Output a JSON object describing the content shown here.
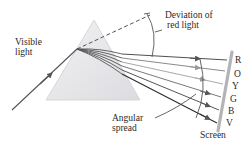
{
  "diagram": {
    "labels": {
      "visible_light": [
        "Visible",
        "light"
      ],
      "deviation": [
        "Deviation of",
        "red light"
      ],
      "angular_spread": [
        "Angular",
        "spread"
      ],
      "screen": "Screen"
    },
    "spectrum": [
      "R",
      "O",
      "Y",
      "G",
      "B",
      "V"
    ],
    "colors": {
      "prism_fill": "#e4e4e6",
      "prism_edge": "#c8c8cc",
      "ray": "#4a4a4a",
      "screen": "#b8b8bc",
      "text": "#2a2a2a"
    }
  }
}
